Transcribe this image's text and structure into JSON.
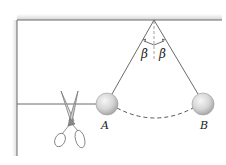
{
  "figure": {
    "labels": {
      "ball_left": "A",
      "ball_right": "B",
      "angle_left": "β",
      "angle_right": "β"
    },
    "elements": [
      {
        "name": "ceiling",
        "type": "fixed support"
      },
      {
        "name": "left-wall",
        "type": "fixed support"
      },
      {
        "name": "pendulum-string-A",
        "type": "string"
      },
      {
        "name": "pendulum-string-B",
        "type": "string"
      },
      {
        "name": "horizontal-string",
        "type": "string"
      },
      {
        "name": "ball-A",
        "type": "sphere"
      },
      {
        "name": "ball-B",
        "type": "sphere"
      },
      {
        "name": "swing-arc",
        "type": "dashed path"
      },
      {
        "name": "vertical-reference",
        "type": "dashed line"
      },
      {
        "name": "scissors",
        "type": "icon"
      }
    ],
    "colors": {
      "line": "#6b6b6b",
      "ceiling_shade": "#d9d9d9",
      "ball_fill": "#d8d8d8",
      "ball_highlight": "#f4f4f4",
      "text": "#222222"
    }
  }
}
